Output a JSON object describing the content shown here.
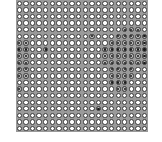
{
  "grid": {
    "rows": 20,
    "cols": 20,
    "colors": {
      "empty_fill": "#ffffff",
      "ring": "#3c3c3c",
      "on_fill": "#b8b8b8",
      "on_dot": "#1a1a1a",
      "background": "#9a9a9a"
    },
    "on_cells": [
      [
        4,
        16
      ],
      [
        4,
        17
      ],
      [
        4,
        18
      ],
      [
        5,
        11
      ],
      [
        5,
        15
      ],
      [
        5,
        16
      ],
      [
        5,
        17
      ],
      [
        5,
        18
      ],
      [
        5,
        19
      ],
      [
        6,
        0
      ],
      [
        6,
        1
      ],
      [
        6,
        14
      ],
      [
        6,
        15
      ],
      [
        6,
        16
      ],
      [
        6,
        17
      ],
      [
        6,
        18
      ],
      [
        6,
        19
      ],
      [
        7,
        0
      ],
      [
        7,
        1
      ],
      [
        7,
        4
      ],
      [
        7,
        13
      ],
      [
        7,
        14
      ],
      [
        7,
        15
      ],
      [
        7,
        16
      ],
      [
        7,
        17
      ],
      [
        7,
        18
      ],
      [
        7,
        19
      ],
      [
        8,
        0
      ],
      [
        8,
        1
      ],
      [
        8,
        13
      ],
      [
        8,
        14
      ],
      [
        8,
        15
      ],
      [
        8,
        16
      ],
      [
        8,
        17
      ],
      [
        8,
        18
      ],
      [
        8,
        19
      ],
      [
        9,
        0
      ],
      [
        9,
        1
      ],
      [
        9,
        13
      ],
      [
        9,
        14
      ],
      [
        9,
        15
      ],
      [
        9,
        16
      ],
      [
        9,
        17
      ],
      [
        9,
        18
      ],
      [
        9,
        19
      ],
      [
        10,
        0
      ],
      [
        10,
        1
      ],
      [
        10,
        14
      ],
      [
        10,
        15
      ],
      [
        10,
        16
      ],
      [
        10,
        17
      ],
      [
        11,
        0
      ],
      [
        11,
        1
      ],
      [
        11,
        14
      ],
      [
        11,
        15
      ],
      [
        11,
        16
      ],
      [
        11,
        17
      ],
      [
        12,
        14
      ],
      [
        12,
        15
      ],
      [
        12,
        16
      ],
      [
        13,
        0
      ],
      [
        13,
        15
      ],
      [
        13,
        16
      ],
      [
        16,
        12
      ]
    ]
  }
}
